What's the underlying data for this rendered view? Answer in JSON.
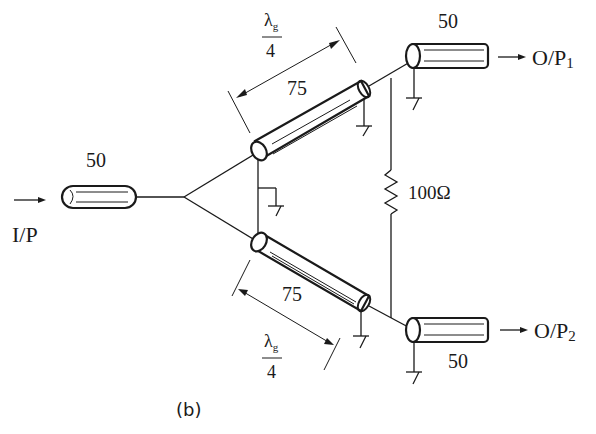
{
  "diagram": {
    "caption": "(b)",
    "input": {
      "label": "I/P",
      "line_impedance": "50"
    },
    "branches": {
      "upper": {
        "impedance": "75",
        "length_num": "λ",
        "length_sub": "g",
        "length_den": "4"
      },
      "lower": {
        "impedance": "75",
        "length_num": "λ",
        "length_sub": "g",
        "length_den": "4"
      }
    },
    "resistor": {
      "value": "100Ω"
    },
    "outputs": [
      {
        "label": "O/P",
        "sub": "1",
        "line_impedance": "50"
      },
      {
        "label": "O/P",
        "sub": "2",
        "line_impedance": "50"
      }
    ],
    "colors": {
      "ink": "#1a1a1a",
      "background": "#ffffff"
    }
  }
}
